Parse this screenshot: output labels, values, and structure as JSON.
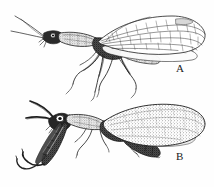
{
  "plate": {
    "background_color": "#fefefe",
    "ink_color": "#1a1a1a",
    "width": 214,
    "height": 187
  },
  "figures": [
    {
      "id": "figure-a",
      "label": "A",
      "label_position": {
        "x": 176,
        "y": 63
      },
      "subject": "snakefly",
      "description": "lateral view of a snakefly with elongate neck-like prothorax, long filiform antennae, slender legs and long membranous veined wings",
      "style": "pen-and-ink line drawing",
      "wing_type": "clear veined",
      "orientation": "head to the left, wings to the right"
    },
    {
      "id": "figure-b",
      "label": "B",
      "label_position": {
        "x": 176,
        "y": 151
      },
      "subject": "mantidfly",
      "description": "lateral view of a mantidfly with enlarged raptorial forelegs, curved antennae, dark segmented abdomen and broad stippled wings",
      "style": "pen-and-ink stippled drawing",
      "wing_type": "broad stippled",
      "orientation": "head to the left, wings to the right"
    }
  ]
}
